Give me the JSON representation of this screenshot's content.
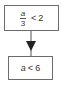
{
  "diagram": {
    "type": "flowchart",
    "colors": {
      "border": "#6b6b6b",
      "arrow": "#222222",
      "text": "#333333"
    },
    "nodes": [
      {
        "id": "top",
        "numerator": "a",
        "denominator": "3",
        "operator": "<",
        "value": "2"
      },
      {
        "id": "bottom",
        "variable": "a",
        "operator": "<",
        "value": "6"
      }
    ],
    "edges": [
      {
        "from": "top",
        "to": "bottom",
        "arrow": "down"
      }
    ]
  }
}
